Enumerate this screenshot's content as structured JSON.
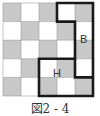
{
  "figure": {
    "caption": "図2 - 4",
    "grid": {
      "cols": 5,
      "rows": 5,
      "checker_colors": {
        "dark": "#c8c8c8",
        "light": "#ffffff"
      },
      "first_cell": "dark"
    },
    "outline_color": "#1a1a1a",
    "labels": [
      {
        "id": "B",
        "text": "B",
        "col": 4,
        "row": 2
      },
      {
        "id": "H",
        "text": "H",
        "col": 3,
        "row": 4
      }
    ]
  }
}
